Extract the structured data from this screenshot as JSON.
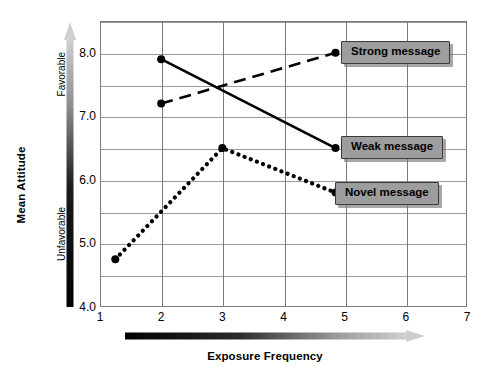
{
  "chart_data": {
    "type": "line",
    "title": "",
    "xlabel": "Exposure Frequency",
    "ylabel": "Mean Attitude",
    "xlim": [
      1,
      7
    ],
    "ylim": [
      4.0,
      8.5
    ],
    "xticks": [
      "1",
      "2",
      "3",
      "4",
      "5",
      "6",
      "7"
    ],
    "yticks": [
      "4.0",
      "5.0",
      "6.0",
      "7.0",
      "8.0"
    ],
    "ytick_values": [
      4.0,
      5.0,
      6.0,
      7.0,
      8.0
    ],
    "grid": "major gridlines every 0.5 on y, every 1 on x",
    "legend_position": "inline callout boxes at line ends",
    "series": [
      {
        "name": "Strong message",
        "style": "dashed",
        "x": [
          2,
          4.85
        ],
        "values": [
          7.2,
          8.0
        ]
      },
      {
        "name": "Weak message",
        "style": "solid",
        "x": [
          2,
          4.85
        ],
        "values": [
          7.9,
          6.5
        ]
      },
      {
        "name": "Novel message",
        "style": "dotted",
        "x": [
          1.25,
          3,
          4.85
        ],
        "values": [
          4.75,
          6.5,
          5.8
        ]
      }
    ],
    "annotations": {
      "y_axis_scale_low": "Unfavorable",
      "y_axis_scale_high": "Favorable",
      "y_axis_gradient": "black (bottom/unfavorable) to light gray (top/favorable), arrow pointing up",
      "x_axis_gradient": "black (left/low frequency) to light gray (right/high frequency), arrow pointing right"
    },
    "colors": {
      "line": "#000000",
      "gridline": "#9a9a9a",
      "frame": "#7a7a7a",
      "callout_fill": "#9d9d9d",
      "callout_border": "#3a3a3a",
      "gradient_dark": "#000000",
      "gradient_light": "#c9c9c9"
    }
  },
  "axes": {
    "y_title": "Mean Attitude",
    "x_title": "Exposure Frequency",
    "y_valence_high": "Favorable",
    "y_valence_low": "Unfavorable"
  },
  "callouts": {
    "strong": "Strong message",
    "weak": "Weak message",
    "novel": "Novel message"
  }
}
